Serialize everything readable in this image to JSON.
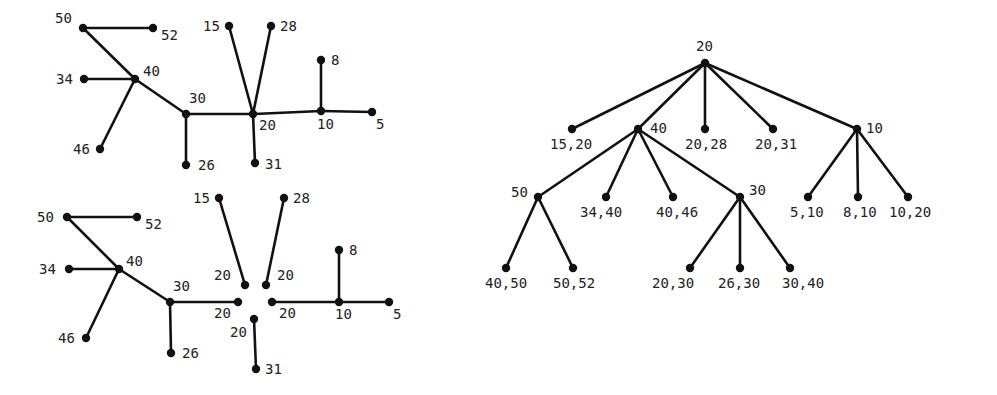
{
  "diagram": {
    "top_left_graph": {
      "nodes": [
        {
          "id": "50",
          "x": 83,
          "y": 28,
          "label": "50",
          "lx": 55,
          "ly": 23
        },
        {
          "id": "52",
          "x": 153,
          "y": 28,
          "label": "52",
          "lx": 161,
          "ly": 40
        },
        {
          "id": "40",
          "x": 135,
          "y": 79,
          "label": "40",
          "lx": 143,
          "ly": 76
        },
        {
          "id": "34",
          "x": 84,
          "y": 79,
          "label": "34",
          "lx": 56,
          "ly": 84
        },
        {
          "id": "30",
          "x": 186,
          "y": 114,
          "label": "30",
          "lx": 189,
          "ly": 103
        },
        {
          "id": "46",
          "x": 100,
          "y": 149,
          "label": "46",
          "lx": 73,
          "ly": 154
        },
        {
          "id": "26",
          "x": 186,
          "y": 165,
          "label": "26",
          "lx": 198,
          "ly": 170
        },
        {
          "id": "20",
          "x": 253,
          "y": 114,
          "label": "20",
          "lx": 259,
          "ly": 130
        },
        {
          "id": "15",
          "x": 229,
          "y": 26,
          "label": "15",
          "lx": 203,
          "ly": 31
        },
        {
          "id": "28",
          "x": 271,
          "y": 26,
          "label": "28",
          "lx": 280,
          "ly": 31
        },
        {
          "id": "10",
          "x": 321,
          "y": 111,
          "label": "10",
          "lx": 317,
          "ly": 129
        },
        {
          "id": "8",
          "x": 321,
          "y": 60,
          "label": "8",
          "lx": 331,
          "ly": 65
        },
        {
          "id": "5",
          "x": 372,
          "y": 112,
          "label": "5",
          "lx": 376,
          "ly": 129
        },
        {
          "id": "31",
          "x": 255,
          "y": 163,
          "label": "31",
          "lx": 265,
          "ly": 169
        }
      ],
      "edges": [
        [
          "50",
          "52"
        ],
        [
          "50",
          "40"
        ],
        [
          "34",
          "40"
        ],
        [
          "40",
          "30"
        ],
        [
          "40",
          "46"
        ],
        [
          "30",
          "26"
        ],
        [
          "30",
          "20"
        ],
        [
          "15",
          "20"
        ],
        [
          "28",
          "20"
        ],
        [
          "20",
          "31"
        ],
        [
          "20",
          "10"
        ],
        [
          "10",
          "8"
        ],
        [
          "10",
          "5"
        ]
      ]
    },
    "bottom_left_graph": {
      "nodes": [
        {
          "id": "50",
          "x": 67,
          "y": 217,
          "label": "50",
          "lx": 37,
          "ly": 222
        },
        {
          "id": "52",
          "x": 137,
          "y": 217,
          "label": "52",
          "lx": 145,
          "ly": 229
        },
        {
          "id": "40",
          "x": 119,
          "y": 269,
          "label": "40",
          "lx": 126,
          "ly": 266
        },
        {
          "id": "34",
          "x": 69,
          "y": 269,
          "label": "34",
          "lx": 39,
          "ly": 274
        },
        {
          "id": "30",
          "x": 170,
          "y": 302,
          "label": "30",
          "lx": 173,
          "ly": 291
        },
        {
          "id": "46",
          "x": 86,
          "y": 338,
          "label": "46",
          "lx": 58,
          "ly": 343
        },
        {
          "id": "26",
          "x": 171,
          "y": 353,
          "label": "26",
          "lx": 182,
          "ly": 358
        },
        {
          "id": "15",
          "x": 219,
          "y": 198,
          "label": "15",
          "lx": 193,
          "ly": 203
        },
        {
          "id": "28",
          "x": 284,
          "y": 198,
          "label": "28",
          "lx": 293,
          "ly": 203
        },
        {
          "id": "20a",
          "x": 245,
          "y": 285,
          "label": "20",
          "lx": 214,
          "ly": 280
        },
        {
          "id": "20b",
          "x": 266,
          "y": 285,
          "label": "20",
          "lx": 277,
          "ly": 280
        },
        {
          "id": "20c",
          "x": 238,
          "y": 302,
          "label": "20",
          "lx": 214,
          "ly": 318
        },
        {
          "id": "20d",
          "x": 272,
          "y": 302,
          "label": "20",
          "lx": 279,
          "ly": 318
        },
        {
          "id": "20e",
          "x": 254,
          "y": 319,
          "label": "20",
          "lx": 230,
          "ly": 337
        },
        {
          "id": "31",
          "x": 256,
          "y": 369,
          "label": "31",
          "lx": 265,
          "ly": 374
        },
        {
          "id": "10",
          "x": 339,
          "y": 302,
          "label": "10",
          "lx": 335,
          "ly": 319
        },
        {
          "id": "8",
          "x": 339,
          "y": 250,
          "label": "8",
          "lx": 349,
          "ly": 255
        },
        {
          "id": "5",
          "x": 389,
          "y": 302,
          "label": "5",
          "lx": 393,
          "ly": 319
        }
      ],
      "edges": [
        [
          "50",
          "52"
        ],
        [
          "50",
          "40"
        ],
        [
          "34",
          "40"
        ],
        [
          "40",
          "30"
        ],
        [
          "40",
          "46"
        ],
        [
          "30",
          "26"
        ],
        [
          "30",
          "20c"
        ],
        [
          "15",
          "20a"
        ],
        [
          "28",
          "20b"
        ],
        [
          "20e",
          "31"
        ],
        [
          "20d",
          "10"
        ],
        [
          "10",
          "8"
        ],
        [
          "10",
          "5"
        ]
      ]
    },
    "right_tree": {
      "nodes": [
        {
          "id": "r20",
          "x": 705,
          "y": 63,
          "label": "20",
          "lx": 696,
          "ly": 51
        },
        {
          "id": "1520",
          "x": 572,
          "y": 129,
          "label": "15,20",
          "lx": 550,
          "ly": 149
        },
        {
          "id": "r40",
          "x": 638,
          "y": 129,
          "label": "40",
          "lx": 650,
          "ly": 133
        },
        {
          "id": "2028",
          "x": 705,
          "y": 129,
          "label": "20,28",
          "lx": 685,
          "ly": 149
        },
        {
          "id": "2031",
          "x": 773,
          "y": 129,
          "label": "20,31",
          "lx": 755,
          "ly": 149
        },
        {
          "id": "r10",
          "x": 857,
          "y": 129,
          "label": "10",
          "lx": 866,
          "ly": 133
        },
        {
          "id": "r50",
          "x": 538,
          "y": 197,
          "label": "50",
          "lx": 511,
          "ly": 197
        },
        {
          "id": "3440",
          "x": 606,
          "y": 197,
          "label": "34,40",
          "lx": 580,
          "ly": 217
        },
        {
          "id": "4046",
          "x": 673,
          "y": 197,
          "label": "40,46",
          "lx": 656,
          "ly": 217
        },
        {
          "id": "r30",
          "x": 740,
          "y": 197,
          "label": "30",
          "lx": 749,
          "ly": 195
        },
        {
          "id": "510",
          "x": 808,
          "y": 197,
          "label": "5,10",
          "lx": 790,
          "ly": 217
        },
        {
          "id": "810",
          "x": 858,
          "y": 197,
          "label": "8,10",
          "lx": 843,
          "ly": 217
        },
        {
          "id": "1020",
          "x": 908,
          "y": 197,
          "label": "10,20",
          "lx": 889,
          "ly": 217
        },
        {
          "id": "4050",
          "x": 506,
          "y": 268,
          "label": "40,50",
          "lx": 485,
          "ly": 288
        },
        {
          "id": "5052",
          "x": 573,
          "y": 268,
          "label": "50,52",
          "lx": 553,
          "ly": 288
        },
        {
          "id": "2030",
          "x": 690,
          "y": 268,
          "label": "20,30",
          "lx": 652,
          "ly": 288
        },
        {
          "id": "2630",
          "x": 740,
          "y": 268,
          "label": "26,30",
          "lx": 718,
          "ly": 288
        },
        {
          "id": "3040",
          "x": 790,
          "y": 268,
          "label": "30,40",
          "lx": 782,
          "ly": 288
        }
      ],
      "edges": [
        [
          "r20",
          "1520"
        ],
        [
          "r20",
          "r40"
        ],
        [
          "r20",
          "2028"
        ],
        [
          "r20",
          "2031"
        ],
        [
          "r20",
          "r10"
        ],
        [
          "r40",
          "r50"
        ],
        [
          "r40",
          "3440"
        ],
        [
          "r40",
          "4046"
        ],
        [
          "r40",
          "r30"
        ],
        [
          "r10",
          "510"
        ],
        [
          "r10",
          "810"
        ],
        [
          "r10",
          "1020"
        ],
        [
          "r50",
          "4050"
        ],
        [
          "r50",
          "5052"
        ],
        [
          "r30",
          "2030"
        ],
        [
          "r30",
          "2630"
        ],
        [
          "r30",
          "3040"
        ]
      ]
    }
  }
}
